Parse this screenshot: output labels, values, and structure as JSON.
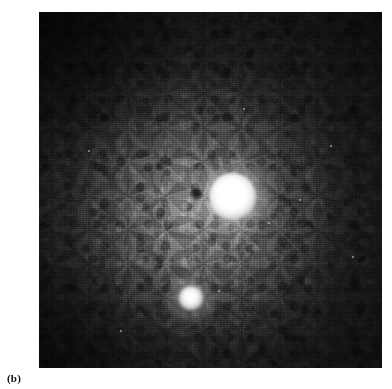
{
  "figure": {
    "caption_label": "(b)",
    "panel_id": "b",
    "type": "grayscale-astronomical-image",
    "plate": {
      "x": 39,
      "y": 12,
      "width": 343,
      "height": 356,
      "background_color": "#4a4a4a",
      "corner_color": "#1b1b1b",
      "halo_color": "#8c8c8c"
    },
    "features": [
      {
        "name": "primary-nucleus",
        "label": "primary nucleus",
        "center_x": 193,
        "center_y": 184,
        "core_radius": 23,
        "glow_radius": 40,
        "peak_color": "#ffffff"
      },
      {
        "name": "companion-source",
        "label": "companion source",
        "center_x": 152,
        "center_y": 286,
        "core_radius": 12,
        "glow_radius": 26,
        "peak_color": "#ffffff"
      },
      {
        "name": "dark-spot",
        "label": "dark spot",
        "center_x": 157,
        "center_y": 181,
        "core_radius": 6,
        "peak_color": "#0a0a0a"
      }
    ],
    "specks": [
      {
        "x": 268,
        "y": 222,
        "size": 2
      },
      {
        "x": 299,
        "y": 199,
        "size": 2
      },
      {
        "x": 330,
        "y": 145,
        "size": 2
      },
      {
        "x": 218,
        "y": 290,
        "size": 2
      },
      {
        "x": 243,
        "y": 108,
        "size": 2
      },
      {
        "x": 120,
        "y": 330,
        "size": 2
      },
      {
        "x": 352,
        "y": 256,
        "size": 2
      },
      {
        "x": 88,
        "y": 150,
        "size": 2
      }
    ]
  }
}
